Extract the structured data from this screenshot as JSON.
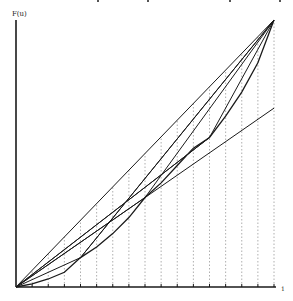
{
  "figure": {
    "y_axis_label": "F(u)",
    "x_axis_end_label": "1",
    "top_crop_fragments_x": [
      98,
      148,
      230,
      280
    ]
  },
  "geometry": {
    "origin": [
      16,
      287
    ],
    "top_right": [
      274,
      20
    ],
    "tick_count": 16
  },
  "curve": {
    "description": "Convex curve from (0,0) to (1,1) below the diagonal, approximated by polygonal chords",
    "points": [
      [
        0,
        0
      ],
      [
        0.0625,
        0.012
      ],
      [
        0.125,
        0.03
      ],
      [
        0.1875,
        0.055
      ],
      [
        0.25,
        0.11
      ],
      [
        0.3125,
        0.15
      ],
      [
        0.375,
        0.2
      ],
      [
        0.4375,
        0.26
      ],
      [
        0.5,
        0.335
      ],
      [
        0.5625,
        0.39
      ],
      [
        0.625,
        0.455
      ],
      [
        0.6875,
        0.52
      ],
      [
        0.75,
        0.56
      ],
      [
        0.8125,
        0.64
      ],
      [
        0.875,
        0.73
      ],
      [
        0.9375,
        0.84
      ],
      [
        1,
        1
      ]
    ]
  },
  "chords": {
    "description": "Straight lines from origin and to the end point through curve points at u = 0.25, 0.5, 0.75, plus the diagonal",
    "diagonal": [
      [
        0,
        0
      ],
      [
        1,
        1
      ]
    ],
    "anchors_u": [
      0.25,
      0.5,
      0.75
    ]
  },
  "colors": {
    "ink": "#1a1a1a",
    "dotted": "#9a9a9a",
    "background": "#ffffff"
  }
}
